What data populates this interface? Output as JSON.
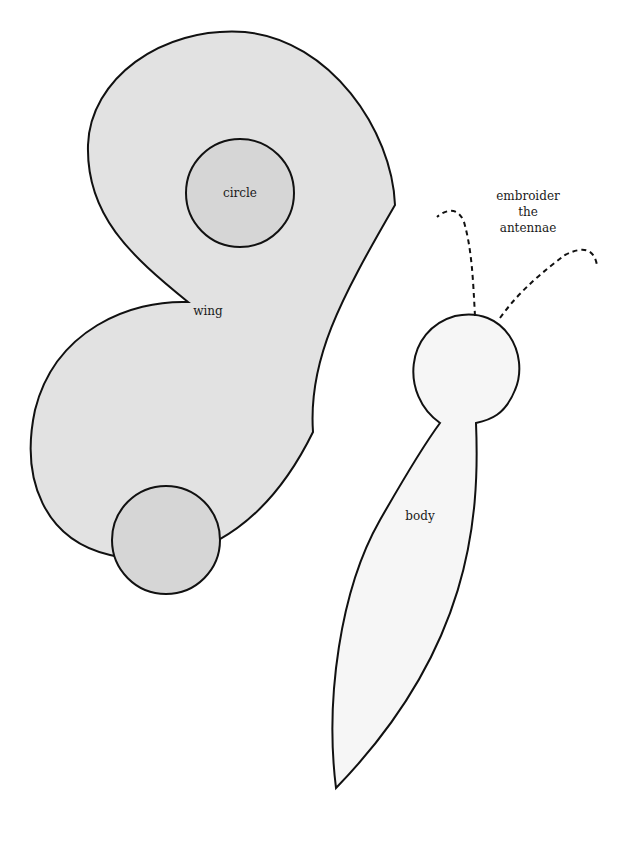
{
  "diagram": {
    "type": "butterfly-sewing-template",
    "labels": {
      "circle": "circle",
      "wing": "wing",
      "body": "body",
      "antennae_line1": "embroider",
      "antennae_line2": "the",
      "antennae_line3": "antennae"
    },
    "colors": {
      "wing_fill": "#e2e2e2",
      "circle_fill": "#d6d6d6",
      "body_fill": "#f6f6f6",
      "outline": "#111111",
      "background": "#ffffff"
    }
  }
}
